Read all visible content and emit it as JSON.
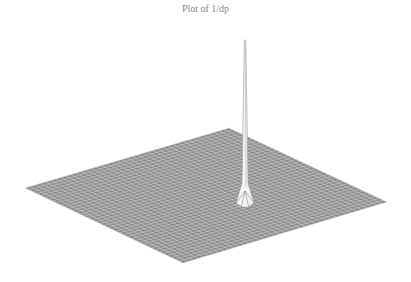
{
  "chart_data": {
    "type": "surface",
    "title": "Plot of 1/dp",
    "xlabel": "",
    "ylabel": "",
    "zlabel": "",
    "grid": true,
    "legend": null,
    "surface": {
      "mesh_color": "#8c8c8c",
      "mesh_line_color": "#d8d8d8",
      "grid_divisions": 40,
      "base_level": 0,
      "peak": {
        "u": 0.62,
        "v": 0.45,
        "relative_height": 1.0
      },
      "corners_px": {
        "left": [
          25,
          188
        ],
        "top": [
          229,
          128
        ],
        "right": [
          387,
          202
        ],
        "bottom": [
          183,
          263
        ]
      },
      "peak_top_px": [
        245,
        40
      ],
      "peak_base_px": [
        245,
        205
      ]
    }
  }
}
